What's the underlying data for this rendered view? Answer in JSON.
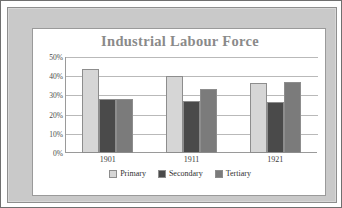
{
  "frame": {
    "outer_border_color": "#6f6f6f",
    "mat_color": "#c9c9c9",
    "card_background": "#ffffff"
  },
  "chart_data": {
    "type": "bar",
    "title": "Industrial Labour Force",
    "xlabel": "",
    "ylabel": "",
    "ylim": [
      0,
      50
    ],
    "ytick_labels": [
      "50%",
      "40%",
      "30%",
      "20%",
      "10%",
      "0%"
    ],
    "ytick_values": [
      50,
      40,
      30,
      20,
      10,
      0
    ],
    "grid": true,
    "legend_position": "bottom",
    "categories": [
      "1901",
      "1911",
      "1921"
    ],
    "series": [
      {
        "name": "Primary",
        "color": "#d6d6d6",
        "values": [
          44,
          40,
          36.5
        ]
      },
      {
        "name": "Secondary",
        "color": "#4a4a4a",
        "values": [
          28,
          27,
          26.5
        ]
      },
      {
        "name": "Tertiary",
        "color": "#7b7b7b",
        "values": [
          28,
          33.5,
          37
        ]
      }
    ]
  }
}
